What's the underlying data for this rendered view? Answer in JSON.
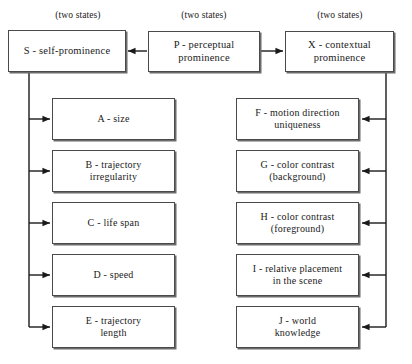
{
  "diagram": {
    "style": {
      "background": "#ffffff",
      "box_border": "#4a4a4a",
      "box_shadow": "#6b6b6b",
      "line_color": "#1a1a1a",
      "text_color": "#1a1a1a"
    },
    "captions": [
      {
        "id": "caption-s",
        "text": "(two states)",
        "x": 28,
        "y": 10,
        "width": 100
      },
      {
        "id": "caption-p",
        "text": "(two states)",
        "x": 154,
        "y": 10,
        "width": 100
      },
      {
        "id": "caption-x",
        "text": "(two states)",
        "x": 290,
        "y": 10,
        "width": 100
      }
    ],
    "top_nodes": [
      {
        "id": "node-s",
        "key": "S",
        "label": "S - self-prominence",
        "x": 8,
        "y": 30,
        "width": 118,
        "height": 42
      },
      {
        "id": "node-p",
        "key": "P",
        "label": "P - perceptual\nprominence",
        "x": 148,
        "y": 31,
        "width": 112,
        "height": 41
      },
      {
        "id": "node-x",
        "key": "X",
        "label": "X - contextual\nprominence",
        "x": 285,
        "y": 31,
        "width": 109,
        "height": 41
      }
    ],
    "left_nodes": [
      {
        "id": "node-a",
        "key": "A",
        "label": "A - size",
        "x": 52,
        "y": 98,
        "width": 123,
        "height": 42
      },
      {
        "id": "node-b",
        "key": "B",
        "label": "B - trajectory\nirregularity",
        "x": 52,
        "y": 150,
        "width": 123,
        "height": 42
      },
      {
        "id": "node-c",
        "key": "C",
        "label": "C - life span",
        "x": 52,
        "y": 202,
        "width": 123,
        "height": 42
      },
      {
        "id": "node-d",
        "key": "D",
        "label": "D - speed",
        "x": 52,
        "y": 254,
        "width": 123,
        "height": 42
      },
      {
        "id": "node-e",
        "key": "E",
        "label": "E - trajectory\nlength",
        "x": 52,
        "y": 306,
        "width": 123,
        "height": 42
      }
    ],
    "right_nodes": [
      {
        "id": "node-f",
        "key": "F",
        "label": "F - motion direction\nuniqueness",
        "x": 236,
        "y": 98,
        "width": 123,
        "height": 42
      },
      {
        "id": "node-g",
        "key": "G",
        "label": "G - color contrast\n(background)",
        "x": 236,
        "y": 150,
        "width": 123,
        "height": 42
      },
      {
        "id": "node-h",
        "key": "H",
        "label": "H - color contrast\n(foreground)",
        "x": 236,
        "y": 202,
        "width": 123,
        "height": 42
      },
      {
        "id": "node-i",
        "key": "I",
        "label": "I - relative placement\nin the scene",
        "x": 236,
        "y": 254,
        "width": 123,
        "height": 42
      },
      {
        "id": "node-j",
        "key": "J",
        "label": "J - world\nknowledge",
        "x": 236,
        "y": 306,
        "width": 123,
        "height": 42
      }
    ],
    "edges": [
      {
        "id": "edge-p-to-s",
        "from": "P",
        "to": "S",
        "direction": "left",
        "label": ""
      },
      {
        "id": "edge-p-to-x",
        "from": "P",
        "to": "X",
        "direction": "right",
        "label": ""
      },
      {
        "id": "edge-s-to-a",
        "from": "S",
        "to": "A",
        "direction": "right",
        "label": ""
      },
      {
        "id": "edge-s-to-b",
        "from": "S",
        "to": "B",
        "direction": "right",
        "label": ""
      },
      {
        "id": "edge-s-to-c",
        "from": "S",
        "to": "C",
        "direction": "right",
        "label": ""
      },
      {
        "id": "edge-s-to-d",
        "from": "S",
        "to": "D",
        "direction": "right",
        "label": ""
      },
      {
        "id": "edge-s-to-e",
        "from": "S",
        "to": "E",
        "direction": "right",
        "label": ""
      },
      {
        "id": "edge-x-to-f",
        "from": "X",
        "to": "F",
        "direction": "left",
        "label": ""
      },
      {
        "id": "edge-x-to-g",
        "from": "X",
        "to": "G",
        "direction": "left",
        "label": ""
      },
      {
        "id": "edge-x-to-h",
        "from": "X",
        "to": "H",
        "direction": "left",
        "label": ""
      },
      {
        "id": "edge-x-to-i",
        "from": "X",
        "to": "I",
        "direction": "left",
        "label": ""
      },
      {
        "id": "edge-x-to-j",
        "from": "X",
        "to": "J",
        "direction": "left",
        "label": ""
      }
    ]
  }
}
